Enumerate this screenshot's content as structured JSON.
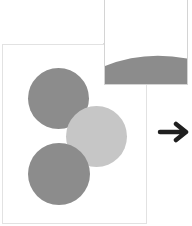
{
  "diagram": {
    "colors": {
      "dark_circle": "#8c8c8c",
      "light_circle": "#c6c6c6",
      "frame_border": "#e2e2e2",
      "callout_border": "#d4d4d4",
      "arrow": "#1f1f1f"
    },
    "circles": [
      {
        "name": "top-circle",
        "cx": 57,
        "cy": 98,
        "d": 61,
        "shade": "dark"
      },
      {
        "name": "middle-circle",
        "cx": 96,
        "cy": 136,
        "d": 61,
        "shade": "light"
      },
      {
        "name": "bottom-circle",
        "cx": 58,
        "cy": 173,
        "d": 62,
        "shade": "dark"
      }
    ],
    "callout": {
      "label": ""
    },
    "arrow": {
      "direction": "right"
    }
  }
}
